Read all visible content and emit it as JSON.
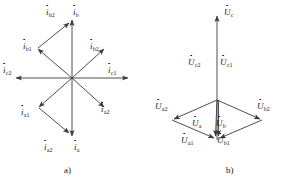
{
  "figure": {
    "background": "#ffffff",
    "stroke": "#3a3a3a",
    "text_color": "#1a1a1a"
  },
  "panel_a": {
    "caption": "a)",
    "center": {
      "x": 72,
      "y": 78
    },
    "vectors": [
      {
        "name": "i_b",
        "symbol": "i",
        "subscript": "b",
        "angle_deg": 90,
        "length": 62,
        "label_x": 84,
        "label_y": 10,
        "dotted": true
      },
      {
        "name": "i_b2_up",
        "symbol": "i",
        "subscript": "b2",
        "angle_deg": 77,
        "length": 60,
        "label_x": 50,
        "label_y": 10,
        "dotted": true
      },
      {
        "name": "i_b1",
        "symbol": "i",
        "subscript": "b1",
        "angle_deg": 137,
        "length": 42,
        "label_x": 20,
        "label_y": 44,
        "dotted": true
      },
      {
        "name": "i_b2",
        "symbol": "i",
        "subscript": "b2",
        "angle_deg": 40,
        "length": 42,
        "label_x": 106,
        "label_y": 44,
        "dotted": true
      },
      {
        "name": "i_c2",
        "symbol": "i",
        "subscript": "c2",
        "angle_deg": 180,
        "length": 60,
        "label_x": 3,
        "label_y": 68,
        "dotted": true
      },
      {
        "name": "i_c1",
        "symbol": "i",
        "subscript": "c1",
        "angle_deg": 0,
        "length": 60,
        "label_x": 106,
        "label_y": 68,
        "dotted": true
      },
      {
        "name": "i_a1",
        "symbol": "i",
        "subscript": "a1",
        "angle_deg": 223,
        "length": 42,
        "label_x": 19,
        "label_y": 109,
        "dotted": true
      },
      {
        "name": "i_a2",
        "symbol": "i",
        "subscript": "a2",
        "angle_deg": 320,
        "length": 42,
        "label_x": 104,
        "label_y": 110,
        "dotted": true
      },
      {
        "name": "i_a",
        "symbol": "i",
        "subscript": "a",
        "angle_deg": 270,
        "length": 62,
        "label_x": 84,
        "label_y": 141,
        "dotted": true
      },
      {
        "name": "i_a2_down",
        "symbol": "i",
        "subscript": "a2",
        "angle_deg": 258,
        "length": 60,
        "label_x": 47,
        "label_y": 141,
        "dotted": true
      }
    ],
    "labels": [
      {
        "name": "label-i-b2-top",
        "symbol": "i",
        "subscript": "b2",
        "x": 46,
        "y": 8
      },
      {
        "name": "label-i-b",
        "symbol": "i",
        "subscript": "b",
        "x": 72,
        "y": 8
      },
      {
        "name": "label-i-b1",
        "symbol": "i",
        "subscript": "b1",
        "x": 23,
        "y": 42
      },
      {
        "name": "label-i-b2-right",
        "symbol": "i",
        "subscript": "b2",
        "x": 89,
        "y": 42
      },
      {
        "name": "label-i-c2",
        "symbol": "i",
        "subscript": "c2",
        "x": 3,
        "y": 66
      },
      {
        "name": "label-i-c1",
        "symbol": "i",
        "subscript": "c1",
        "x": 108,
        "y": 66
      },
      {
        "name": "label-i-a1",
        "symbol": "i",
        "subscript": "a1",
        "x": 21,
        "y": 108
      },
      {
        "name": "label-i-a2-right",
        "symbol": "i",
        "subscript": "a2",
        "x": 100,
        "y": 105
      },
      {
        "name": "label-i-a2-bottom",
        "symbol": "i",
        "subscript": "a2",
        "x": 44,
        "y": 143
      },
      {
        "name": "label-i-a",
        "symbol": "i",
        "subscript": "a",
        "x": 72,
        "y": 143
      }
    ]
  },
  "panel_b": {
    "caption": "b)",
    "center": {
      "x": 217,
      "y": 140
    },
    "vectors": [
      {
        "name": "U_c",
        "symbol": "U",
        "subscript": "c",
        "label_x": 224,
        "label_y": 8
      },
      {
        "name": "U_c2",
        "symbol": "U",
        "subscript": "c2",
        "label_x": 191,
        "label_y": 60
      },
      {
        "name": "U_c1",
        "symbol": "U",
        "subscript": "c1",
        "label_x": 221,
        "label_y": 60
      },
      {
        "name": "U_a2",
        "symbol": "U",
        "subscript": "a2",
        "label_x": 161,
        "label_y": 104
      },
      {
        "name": "U_b2",
        "symbol": "U",
        "subscript": "b2",
        "label_x": 262,
        "label_y": 104
      },
      {
        "name": "U_a",
        "symbol": "U",
        "subscript": "a",
        "label_x": 193,
        "label_y": 122
      },
      {
        "name": "U_b",
        "symbol": "U",
        "subscript": "b",
        "label_x": 218,
        "label_y": 122
      },
      {
        "name": "U_a1",
        "symbol": "U",
        "subscript": "a1",
        "label_x": 186,
        "label_y": 137
      },
      {
        "name": "U_b1",
        "symbol": "U",
        "subscript": "b1",
        "label_x": 222,
        "label_y": 137
      }
    ],
    "labels": [
      {
        "name": "label-u-c",
        "symbol": "U",
        "subscript": "c",
        "x": 224,
        "y": 8
      },
      {
        "name": "label-u-c2",
        "symbol": "U",
        "subscript": "c2",
        "x": 188,
        "y": 58
      },
      {
        "name": "label-u-c1",
        "symbol": "U",
        "subscript": "c1",
        "x": 219,
        "y": 58
      },
      {
        "name": "label-u-a2",
        "symbol": "U",
        "subscript": "a2",
        "x": 156,
        "y": 103
      },
      {
        "name": "label-u-b2",
        "symbol": "U",
        "subscript": "b2",
        "x": 256,
        "y": 103
      },
      {
        "name": "label-u-a",
        "symbol": "U",
        "subscript": "a",
        "x": 192,
        "y": 120
      },
      {
        "name": "label-u-b",
        "symbol": "U",
        "subscript": "b",
        "x": 215,
        "y": 120
      },
      {
        "name": "label-u-a1",
        "symbol": "U",
        "subscript": "a1",
        "x": 182,
        "y": 136
      },
      {
        "name": "label-u-b1",
        "symbol": "U",
        "subscript": "b1",
        "x": 216,
        "y": 136
      }
    ]
  },
  "captions": {
    "a": {
      "text": "a)",
      "x": 64,
      "y": 165
    },
    "b": {
      "text": "b)",
      "x": 226,
      "y": 165
    }
  }
}
